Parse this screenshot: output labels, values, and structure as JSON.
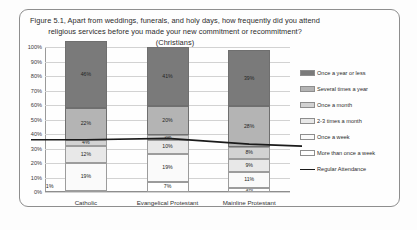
{
  "figure": {
    "title": "Figure 5.1, Apart from weddings, funerals, and holy days, how frequently did you attend religious services before you made your new commitment or recommitment? (Christians)"
  },
  "chart_data": {
    "type": "bar",
    "stacked": true,
    "title": "Figure 5.1, Apart from weddings, funerals, and holy days, how frequently did you attend religious services before you made your new commitment or recommitment? (Christians)",
    "xlabel": "",
    "ylabel": "",
    "ylim": [
      0,
      100
    ],
    "ytick_labels": [
      "0%",
      "10%",
      "20%",
      "30%",
      "40%",
      "50%",
      "60%",
      "70%",
      "80%",
      "90%",
      "100%"
    ],
    "ytick_values": [
      0,
      10,
      20,
      30,
      40,
      50,
      60,
      70,
      80,
      90,
      100
    ],
    "grid": true,
    "legend_position": "right",
    "categories": [
      "Catholic",
      "Evangelical Protestant",
      "Mainline Protestant"
    ],
    "series": [
      {
        "name": "More than once a week",
        "color": "#ffffff",
        "values": [
          1,
          7,
          3
        ],
        "labels": [
          "1%",
          "7%",
          "3%"
        ]
      },
      {
        "name": "Once a week",
        "color": "#fafafa",
        "values": [
          19,
          19,
          11
        ],
        "labels": [
          "19%",
          "19%",
          "11%"
        ]
      },
      {
        "name": "2-3 times a month",
        "color": "#e8e8e8",
        "values": [
          12,
          10,
          9
        ],
        "labels": [
          "12%",
          "10%",
          "9%"
        ]
      },
      {
        "name": "Once a month",
        "color": "#d2d2d2",
        "values": [
          4,
          3,
          8
        ],
        "labels": [
          "4%",
          "3%",
          "8%"
        ]
      },
      {
        "name": "Several times a year",
        "color": "#b4b4b4",
        "values": [
          22,
          20,
          28
        ],
        "labels": [
          "22%",
          "20%",
          "28%"
        ]
      },
      {
        "name": "Once a year or less",
        "color": "#7a7a7a",
        "values": [
          46,
          41,
          39
        ],
        "labels": [
          "46%",
          "41%",
          "39%"
        ]
      }
    ],
    "line_series": {
      "name": "Regular Attendance",
      "color": "#1a1a1a",
      "values": [
        36,
        37,
        33
      ]
    }
  },
  "legend": {
    "items": [
      {
        "label": "Once a year or less",
        "swatch": "dark-gray-swatch"
      },
      {
        "label": "Several times a year",
        "swatch": "medium-gray-swatch"
      },
      {
        "label": "Once a month",
        "swatch": "gray-swatch"
      },
      {
        "label": "2-3 times a month",
        "swatch": "light-gray-swatch"
      },
      {
        "label": "Once a week",
        "swatch": "off-white-swatch"
      },
      {
        "label": "More than once a week",
        "swatch": "white-swatch"
      },
      {
        "label": "Regular Attendance",
        "swatch": "black-line-swatch"
      }
    ]
  }
}
